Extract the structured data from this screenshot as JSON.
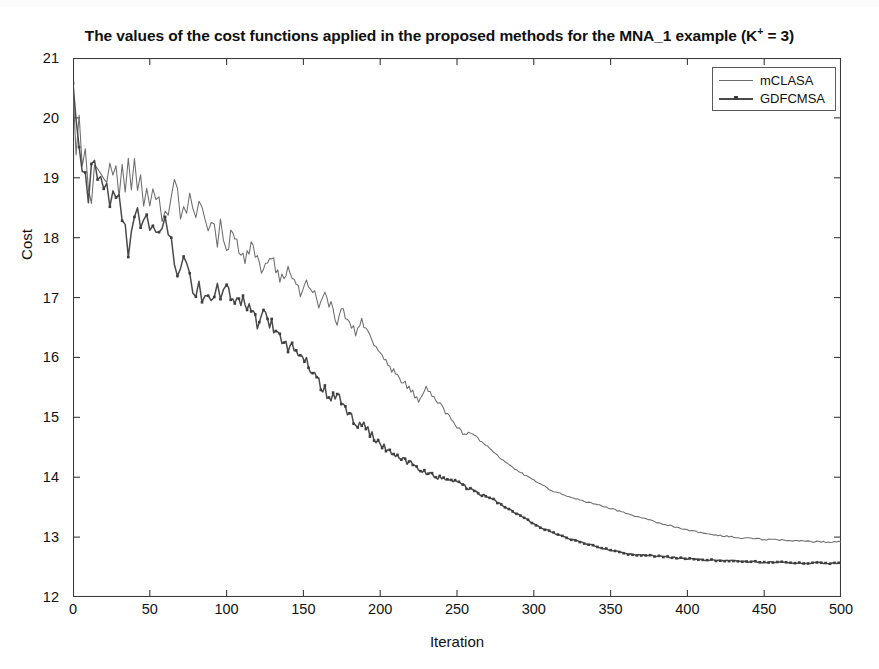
{
  "chart_data": {
    "type": "line",
    "title": "The values of the cost functions applied in the proposed methods for the MNA_1 example (K+ = 3)",
    "title_main": "The values of the cost functions applied in the proposed methods for the MNA_1 example (K",
    "title_sup": "+",
    "title_tail": " = 3)",
    "xlabel": "Iteration",
    "ylabel": "Cost",
    "xlim": [
      0,
      500
    ],
    "ylim": [
      12,
      21
    ],
    "xticks": [
      0,
      50,
      100,
      150,
      200,
      250,
      300,
      350,
      400,
      450,
      500
    ],
    "xtick_labels": [
      "0",
      "50",
      "100",
      "150",
      "200",
      "250",
      "300",
      "350",
      "400",
      "450",
      "500"
    ],
    "yticks": [
      12,
      13,
      14,
      15,
      16,
      17,
      18,
      19,
      20,
      21
    ],
    "ytick_labels": [
      "12",
      "13",
      "14",
      "15",
      "16",
      "17",
      "18",
      "19",
      "20",
      "21"
    ],
    "grid": false,
    "legend_position": "top-right",
    "background_color": "#ffffff",
    "axis_color": "#3a3a3a",
    "series": [
      {
        "name": "mCLASA",
        "color": "#6d6d6d",
        "marker": "none",
        "line_width": 1.05,
        "x": [
          0,
          2,
          4,
          6,
          8,
          10,
          12,
          14,
          16,
          18,
          20,
          22,
          24,
          26,
          28,
          30,
          32,
          34,
          36,
          38,
          40,
          42,
          44,
          46,
          48,
          50,
          52,
          54,
          56,
          58,
          60,
          62,
          64,
          66,
          68,
          70,
          72,
          74,
          76,
          78,
          80,
          82,
          84,
          86,
          88,
          90,
          92,
          94,
          96,
          98,
          100,
          104,
          108,
          112,
          116,
          120,
          124,
          128,
          132,
          136,
          140,
          144,
          148,
          152,
          156,
          160,
          164,
          168,
          172,
          176,
          180,
          184,
          188,
          192,
          196,
          200,
          205,
          210,
          215,
          220,
          225,
          230,
          235,
          240,
          245,
          250,
          255,
          260,
          265,
          270,
          275,
          280,
          285,
          290,
          295,
          300,
          310,
          320,
          330,
          340,
          350,
          360,
          370,
          380,
          390,
          400,
          410,
          420,
          430,
          440,
          450,
          460,
          470,
          480,
          490,
          500
        ],
        "y": [
          20.6,
          19.55,
          20.1,
          19.3,
          19.52,
          19.0,
          18.65,
          19.1,
          19.22,
          18.95,
          19.18,
          19.05,
          19.3,
          18.88,
          19.12,
          18.72,
          19.08,
          18.8,
          19.22,
          18.86,
          19.16,
          18.95,
          19.05,
          18.62,
          18.78,
          18.58,
          18.82,
          18.48,
          18.66,
          18.35,
          18.52,
          18.3,
          18.7,
          18.95,
          18.72,
          18.38,
          18.55,
          18.28,
          18.85,
          18.6,
          18.42,
          18.72,
          18.55,
          18.3,
          18.12,
          18.4,
          18.22,
          17.95,
          18.3,
          18.02,
          17.8,
          18.1,
          17.85,
          17.62,
          17.9,
          17.68,
          17.45,
          17.72,
          17.5,
          17.28,
          17.55,
          17.3,
          17.1,
          17.35,
          17.12,
          16.9,
          17.08,
          16.85,
          16.62,
          16.8,
          16.58,
          16.4,
          16.62,
          16.4,
          16.18,
          16.05,
          15.9,
          15.72,
          15.6,
          15.45,
          15.3,
          15.52,
          15.35,
          15.18,
          15.0,
          14.85,
          14.7,
          14.75,
          14.62,
          14.5,
          14.4,
          14.28,
          14.18,
          14.1,
          14.02,
          13.95,
          13.8,
          13.7,
          13.62,
          13.55,
          13.48,
          13.4,
          13.32,
          13.25,
          13.18,
          13.12,
          13.07,
          13.03,
          13.0,
          12.98,
          12.96,
          12.95,
          12.94,
          12.93,
          12.92,
          12.92
        ]
      },
      {
        "name": "GDFCMSA",
        "color": "#4a4a4a",
        "marker": "square",
        "line_width": 1.5,
        "x": [
          0,
          2,
          4,
          6,
          8,
          10,
          12,
          14,
          16,
          18,
          20,
          22,
          24,
          26,
          28,
          30,
          32,
          34,
          36,
          38,
          40,
          42,
          44,
          46,
          48,
          50,
          52,
          54,
          56,
          58,
          60,
          62,
          64,
          66,
          68,
          70,
          72,
          74,
          76,
          78,
          80,
          82,
          84,
          86,
          88,
          90,
          92,
          94,
          96,
          98,
          100,
          104,
          108,
          112,
          116,
          120,
          124,
          128,
          132,
          136,
          140,
          144,
          148,
          152,
          156,
          160,
          164,
          168,
          172,
          176,
          180,
          184,
          188,
          192,
          196,
          200,
          205,
          210,
          215,
          220,
          225,
          230,
          235,
          240,
          245,
          250,
          255,
          260,
          265,
          270,
          275,
          280,
          285,
          290,
          295,
          300,
          310,
          320,
          330,
          340,
          350,
          360,
          370,
          380,
          390,
          400,
          410,
          420,
          430,
          440,
          450,
          460,
          470,
          480,
          490,
          500
        ],
        "y": [
          20.58,
          20.12,
          19.4,
          19.05,
          19.18,
          18.6,
          19.12,
          19.2,
          18.95,
          19.18,
          18.7,
          18.92,
          18.65,
          18.88,
          18.7,
          18.62,
          18.38,
          18.05,
          17.8,
          18.0,
          18.22,
          18.38,
          18.32,
          18.4,
          18.25,
          18.05,
          18.22,
          17.95,
          18.15,
          18.3,
          18.2,
          18.08,
          17.85,
          17.7,
          17.48,
          17.62,
          17.8,
          17.62,
          17.4,
          17.22,
          17.08,
          17.2,
          17.05,
          16.9,
          17.12,
          17.0,
          17.08,
          17.15,
          17.05,
          17.12,
          17.18,
          17.02,
          16.88,
          16.95,
          16.7,
          16.58,
          16.72,
          16.6,
          16.42,
          16.28,
          16.12,
          16.2,
          16.05,
          15.92,
          15.78,
          15.6,
          15.45,
          15.3,
          15.4,
          15.25,
          15.05,
          14.88,
          14.9,
          14.78,
          14.65,
          14.55,
          14.45,
          14.38,
          14.3,
          14.22,
          14.15,
          14.08,
          14.02,
          13.98,
          13.95,
          13.92,
          13.85,
          13.78,
          13.72,
          13.68,
          13.6,
          13.52,
          13.45,
          13.38,
          13.3,
          13.22,
          13.1,
          13.0,
          12.92,
          12.85,
          12.78,
          12.72,
          12.7,
          12.68,
          12.66,
          12.64,
          12.62,
          12.61,
          12.6,
          12.59,
          12.58,
          12.58,
          12.57,
          12.57,
          12.57,
          12.56
        ]
      }
    ],
    "legend": [
      {
        "label": "mCLASA"
      },
      {
        "label": "GDFCMSA"
      }
    ]
  }
}
